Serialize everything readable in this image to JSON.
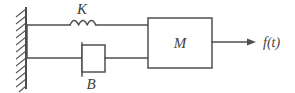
{
  "diagram": {
    "type": "mechanical-schematic",
    "background_color": "#ffffff",
    "stroke_color": "#4f4f4f",
    "labels": {
      "spring": "K",
      "damper": "B",
      "mass": "M",
      "force": "f(t)"
    },
    "elements": {
      "wall": {
        "name": "fixed-wall",
        "hatched": true,
        "x": 26,
        "y_top": 8,
        "y_bottom": 88
      },
      "spring": {
        "name": "spring-element",
        "label": "K",
        "coil_count": 3,
        "line_y": 25,
        "x_start": 26,
        "x_end": 148
      },
      "damper": {
        "name": "damper-element",
        "label": "B",
        "line_y": 58,
        "x_start": 26,
        "x_end": 148,
        "box_x": 82,
        "box_width": 23,
        "box_y": 45,
        "box_height": 27
      },
      "mass": {
        "name": "mass-block",
        "label": "M",
        "x": 148,
        "y": 18,
        "width": 64,
        "height": 50
      },
      "force_arrow": {
        "name": "force-arrow",
        "label": "f(t)",
        "y": 42,
        "x_start": 212,
        "x_end": 255,
        "direction": "right"
      }
    }
  }
}
